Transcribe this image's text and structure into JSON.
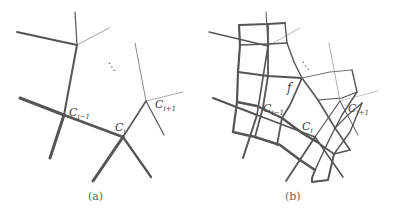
{
  "panels": [
    {
      "id": "a",
      "caption": "(a)",
      "labels": {
        "c_prev": {
          "base": "C",
          "sub": "i−1"
        },
        "c_cur": {
          "base": "C",
          "sub": "i"
        },
        "c_next": {
          "base": "C",
          "sub": "i+1"
        },
        "ellipsis": "⋱"
      }
    },
    {
      "id": "b",
      "caption": "(b)",
      "labels": {
        "face": "f",
        "c_prev": {
          "base": "C",
          "sub": "i−1"
        },
        "c_cur": {
          "base": "C",
          "sub": "i"
        },
        "c_next": {
          "base": "C",
          "sub": "i+1"
        },
        "ellipsis": "⋱"
      }
    }
  ],
  "colors": {
    "stroke": "#555555",
    "text": "#444444",
    "caption": "#666666"
  }
}
